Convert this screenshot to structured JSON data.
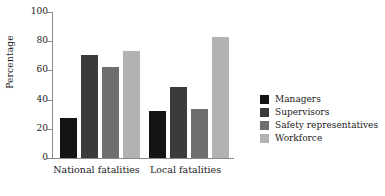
{
  "chart_data": {
    "type": "bar",
    "title": "",
    "xlabel": "",
    "ylabel": "Percentage",
    "ylim": [
      0,
      100
    ],
    "yticks": [
      0,
      20,
      40,
      60,
      80,
      100
    ],
    "ytick_labels": [
      "0",
      "20",
      "40",
      "60",
      "80",
      "100"
    ],
    "grid": false,
    "legend_position": "right",
    "categories": [
      "National fatalities",
      "Local fatalities"
    ],
    "series": [
      {
        "name": "Managers",
        "color": "#141414",
        "values": [
          27.5,
          32.0
        ]
      },
      {
        "name": "Supervisors",
        "color": "#3b3b3b",
        "values": [
          70.5,
          48.5
        ]
      },
      {
        "name": "Safety representatives",
        "color": "#6e6e6e",
        "values": [
          62.0,
          33.5
        ]
      },
      {
        "name": "Workforce",
        "color": "#b2b2b2",
        "values": [
          73.5,
          83.0
        ]
      }
    ]
  }
}
